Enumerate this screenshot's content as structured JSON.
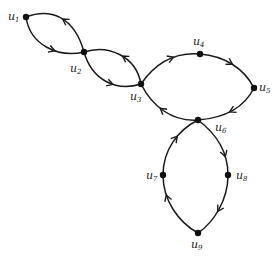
{
  "diagram": {
    "type": "directed-graph",
    "nodes": [
      {
        "id": "u1",
        "label": "u",
        "sub": "1",
        "x": 26,
        "y": 17,
        "lx": 8,
        "ly": 20
      },
      {
        "id": "u2",
        "label": "u",
        "sub": "2",
        "x": 84,
        "y": 52,
        "lx": 70,
        "ly": 72
      },
      {
        "id": "u3",
        "label": "u",
        "sub": "3",
        "x": 141,
        "y": 84,
        "lx": 130,
        "ly": 100
      },
      {
        "id": "u4",
        "label": "u",
        "sub": "4",
        "x": 200,
        "y": 54,
        "lx": 193,
        "ly": 45
      },
      {
        "id": "u5",
        "label": "u",
        "sub": "5",
        "x": 254,
        "y": 88,
        "lx": 259,
        "ly": 91
      },
      {
        "id": "u6",
        "label": "u",
        "sub": "6",
        "x": 198,
        "y": 120,
        "lx": 215,
        "ly": 131
      },
      {
        "id": "u7",
        "label": "u",
        "sub": "7",
        "x": 163,
        "y": 175,
        "lx": 146,
        "ly": 179
      },
      {
        "id": "u8",
        "label": "u",
        "sub": "8",
        "x": 228,
        "y": 175,
        "lx": 236,
        "ly": 179
      },
      {
        "id": "u9",
        "label": "u",
        "sub": "9",
        "x": 198,
        "y": 233,
        "lx": 191,
        "ly": 248
      }
    ],
    "edges": [
      {
        "from": "u2",
        "to": "u1",
        "path": "M84,52 C74,16 50,8 26,17",
        "arrow_at": 0.5
      },
      {
        "from": "u1",
        "to": "u2",
        "path": "M26,17 C30,45 58,58 84,52",
        "arrow_at": 0.6
      },
      {
        "from": "u3",
        "to": "u2",
        "path": "M141,84 C136,56 108,44 84,52",
        "arrow_at": 0.45
      },
      {
        "from": "u2",
        "to": "u3",
        "path": "M84,52 C92,80 116,92 141,84",
        "arrow_at": 0.6
      },
      {
        "from": "u3",
        "to": "u4",
        "path": "M141,84 C156,62 176,52 200,54",
        "arrow_at": 0.6
      },
      {
        "from": "u4",
        "to": "u5",
        "path": "M200,54 C224,56 244,68 254,88",
        "arrow_at": 0.5
      },
      {
        "from": "u5",
        "to": "u6",
        "path": "M254,88 C244,108 224,118 198,120",
        "arrow_at": 0.5
      },
      {
        "from": "u6",
        "to": "u3",
        "path": "M198,120 C172,122 152,106 141,84",
        "arrow_at": 0.55
      },
      {
        "from": "u6",
        "to": "u8",
        "path": "M198,120 C214,132 228,150 228,175",
        "arrow_at": 0.7
      },
      {
        "from": "u8",
        "to": "u9",
        "path": "M228,175 C228,200 214,222 198,233",
        "arrow_at": 0.55
      },
      {
        "from": "u9",
        "to": "u7",
        "path": "M198,233 C178,222 163,200 163,175",
        "arrow_at": 0.7
      },
      {
        "from": "u7",
        "to": "u6",
        "path": "M163,175 C163,150 178,130 198,120",
        "arrow_at": 0.6
      }
    ]
  }
}
